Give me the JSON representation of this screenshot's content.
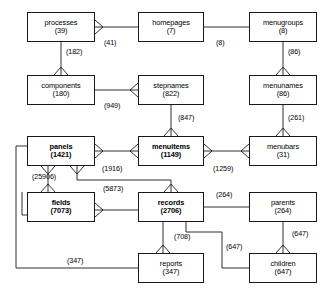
{
  "diagram": {
    "type": "crowsfoot-er-diagram",
    "stroke_color": "#1a1a1a",
    "background": "#ffffff",
    "entities": [
      {
        "id": "processes",
        "name": "processes",
        "count": "(39)",
        "bold": false,
        "x": 27,
        "y": 12,
        "w": 68,
        "h": 30
      },
      {
        "id": "homepages",
        "name": "homepages",
        "count": "(7)",
        "bold": false,
        "x": 138,
        "y": 12,
        "w": 66,
        "h": 30
      },
      {
        "id": "menugroups",
        "name": "menugroups",
        "count": "(8)",
        "bold": false,
        "x": 249,
        "y": 12,
        "w": 68,
        "h": 30
      },
      {
        "id": "components",
        "name": "components",
        "count": "(180)",
        "bold": false,
        "x": 27,
        "y": 75,
        "w": 68,
        "h": 30
      },
      {
        "id": "stepnames",
        "name": "stepnames",
        "count": "(822)",
        "bold": false,
        "x": 138,
        "y": 75,
        "w": 66,
        "h": 30
      },
      {
        "id": "menunames",
        "name": "menunames",
        "count": "(86)",
        "bold": false,
        "x": 249,
        "y": 75,
        "w": 68,
        "h": 30
      },
      {
        "id": "panels",
        "name": "panels",
        "count": "(1421)",
        "bold": true,
        "x": 27,
        "y": 136,
        "w": 68,
        "h": 30
      },
      {
        "id": "menuitems",
        "name": "menuitems",
        "count": "(1149)",
        "bold": true,
        "x": 138,
        "y": 136,
        "w": 66,
        "h": 30
      },
      {
        "id": "menubars",
        "name": "menubars",
        "count": "(31)",
        "bold": false,
        "x": 249,
        "y": 136,
        "w": 68,
        "h": 30
      },
      {
        "id": "fields",
        "name": "fields",
        "count": "(7073)",
        "bold": true,
        "x": 27,
        "y": 192,
        "w": 68,
        "h": 30
      },
      {
        "id": "records",
        "name": "records",
        "count": "(2706)",
        "bold": true,
        "x": 138,
        "y": 192,
        "w": 66,
        "h": 30
      },
      {
        "id": "parents",
        "name": "parents",
        "count": "(264)",
        "bold": false,
        "x": 249,
        "y": 192,
        "w": 68,
        "h": 30
      },
      {
        "id": "reports",
        "name": "reports",
        "count": "(347)",
        "bold": false,
        "x": 138,
        "y": 253,
        "w": 66,
        "h": 30
      },
      {
        "id": "children",
        "name": "children",
        "count": "(647)",
        "bold": false,
        "x": 249,
        "y": 253,
        "w": 68,
        "h": 30
      }
    ],
    "edge_labels": [
      {
        "id": "lbl-processes-homepages",
        "text": "(41)",
        "x": 104,
        "y": 38
      },
      {
        "id": "lbl-homepages-menugroups",
        "text": "(8)",
        "x": 216,
        "y": 38
      },
      {
        "id": "lbl-processes-components",
        "text": "(182)",
        "x": 66,
        "y": 47
      },
      {
        "id": "lbl-menugroups-menunames",
        "text": "(86)",
        "x": 288,
        "y": 47
      },
      {
        "id": "lbl-components-stepnames",
        "text": "(949)",
        "x": 104,
        "y": 101
      },
      {
        "id": "lbl-stepnames-menuitems",
        "text": "(847)",
        "x": 178,
        "y": 113
      },
      {
        "id": "lbl-menunames-menubars",
        "text": "(261)",
        "x": 288,
        "y": 113
      },
      {
        "id": "lbl-panels-menuitems",
        "text": "(1916)",
        "x": 104,
        "y": 164
      },
      {
        "id": "lbl-menuitems-menubars",
        "text": "(1259)",
        "x": 215,
        "y": 164
      },
      {
        "id": "lbl-panels-fields",
        "text": "(25906)",
        "x": 34,
        "y": 174
      },
      {
        "id": "lbl-panels-records",
        "text": "(5873)",
        "x": 104,
        "y": 185
      },
      {
        "id": "lbl-records-parents",
        "text": "(264)",
        "x": 216,
        "y": 190
      },
      {
        "id": "lbl-records-reports",
        "text": "(708)",
        "x": 176,
        "y": 232
      },
      {
        "id": "lbl-parents-children",
        "text": "(647)",
        "x": 293,
        "y": 230
      },
      {
        "id": "lbl-records-children",
        "text": "(647)",
        "x": 228,
        "y": 242
      },
      {
        "id": "lbl-fields-reports",
        "text": "(347)",
        "x": 69,
        "y": 258
      }
    ],
    "relationships": [
      {
        "from": "processes",
        "to": "homepages",
        "label": "(41)",
        "from_marker": "crowsfoot-right"
      },
      {
        "from": "homepages",
        "to": "menugroups",
        "label": "(8)",
        "from_marker": "none"
      },
      {
        "from": "processes",
        "to": "components",
        "label": "(182)",
        "to_marker": "crowsfoot-down"
      },
      {
        "from": "menugroups",
        "to": "menunames",
        "label": "(86)",
        "to_marker": "crowsfoot-down"
      },
      {
        "from": "components",
        "to": "stepnames",
        "label": "(949)",
        "to_marker": "crowsfoot-left"
      },
      {
        "from": "stepnames",
        "to": "menuitems",
        "label": "(847)",
        "to_marker": "crowsfoot-down"
      },
      {
        "from": "menunames",
        "to": "menubars",
        "label": "(261)",
        "to_marker": "crowsfoot-down"
      },
      {
        "from": "panels",
        "to": "menuitems",
        "label": "(1916)",
        "markers": "crowsfoot-both"
      },
      {
        "from": "menuitems",
        "to": "menubars",
        "label": "(1259)",
        "markers": "crowsfoot-both"
      },
      {
        "from": "panels",
        "to": "fields",
        "label": "(25906)",
        "to_marker": "crowsfoot-down"
      },
      {
        "from": "panels",
        "to": "records",
        "label": "(5873)",
        "to_marker": "crowsfoot-down"
      },
      {
        "from": "fields",
        "to": "records",
        "label": "",
        "from_marker": "crowsfoot-right"
      },
      {
        "from": "records",
        "to": "parents",
        "label": "(264)",
        "from_marker": "none"
      },
      {
        "from": "records",
        "to": "reports",
        "label": "(708)",
        "to_marker": "crowsfoot-down"
      },
      {
        "from": "parents",
        "to": "children",
        "label": "(647)",
        "to_marker": "crowsfoot-down"
      },
      {
        "from": "records",
        "to": "children",
        "label": "(647)",
        "from_marker": "none"
      },
      {
        "from": "fields",
        "to": "reports",
        "label": "(347)",
        "from_marker": "none"
      }
    ]
  }
}
